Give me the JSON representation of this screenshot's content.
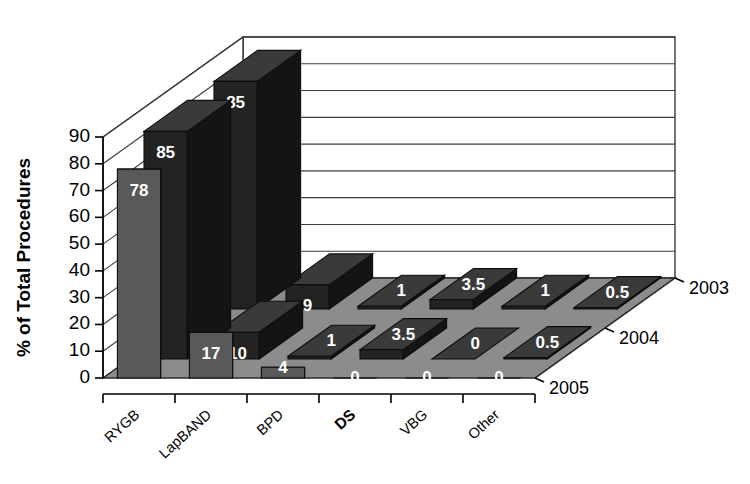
{
  "chart_data": {
    "type": "bar",
    "subtype": "3d-grouped-bar",
    "title": "",
    "xlabel": "",
    "ylabel": "% of Total Procedures",
    "categories": [
      "RYGB",
      "LapBAND",
      "BPD",
      "DS",
      "VBG",
      "Other"
    ],
    "emphasized_categories": [
      "DS"
    ],
    "series": [
      {
        "name": "2003",
        "values": [
          85,
          9,
          1,
          3.5,
          1,
          0.5
        ]
      },
      {
        "name": "2004",
        "values": [
          85,
          10,
          1,
          3.5,
          0,
          0.5
        ]
      },
      {
        "name": "2005",
        "values": [
          78,
          17,
          4,
          0,
          0,
          0
        ]
      }
    ],
    "series_order_back_to_front": [
      "2003",
      "2004",
      "2005"
    ],
    "value_labels": {
      "2003": [
        "85",
        "9",
        "1",
        "3.5",
        "1",
        "0.5"
      ],
      "2004": [
        "85",
        "10",
        "1",
        "3.5",
        "0",
        "0.5"
      ],
      "2005": [
        "78",
        "17",
        "4",
        "0",
        "0",
        "0"
      ]
    },
    "ylim": [
      0,
      90
    ],
    "yticks": [
      0,
      10,
      20,
      30,
      40,
      50,
      60,
      70,
      80,
      90
    ],
    "ytick_labels": [
      "0",
      "10",
      "20",
      "30",
      "40",
      "50",
      "60",
      "70",
      "80",
      "90"
    ],
    "grid": true,
    "grid_orientation": "horizontal",
    "legend": "depth-axis",
    "depth_axis_labels": [
      "2003",
      "2004",
      "2005"
    ],
    "colors": {
      "series_2003_front": "#232323",
      "series_2003_side": "#141414",
      "series_2003_top": "#3a3a3a",
      "series_2004_front": "#232323",
      "series_2004_side": "#141414",
      "series_2004_top": "#3a3a3a",
      "series_2005_front": "#595959",
      "series_2005_side": "#3a3a3a",
      "series_2005_top": "#6e6e6e",
      "floor": "#8c8c8c",
      "wall": "#ffffff",
      "axis": "#000000",
      "gridline": "#3c3c3c",
      "value_text": "#ffffff"
    }
  }
}
